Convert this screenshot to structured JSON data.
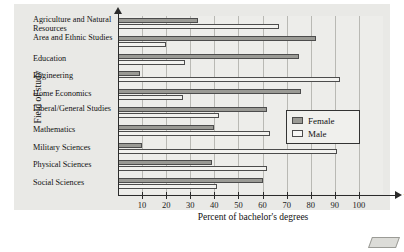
{
  "chart_data": {
    "type": "bar",
    "orientation": "horizontal",
    "title": "",
    "xlabel": "Percent of bachelor's degrees",
    "ylabel": "Field of study",
    "xlim": [
      0,
      110
    ],
    "xticks": [
      10,
      20,
      30,
      40,
      50,
      60,
      70,
      80,
      90,
      100
    ],
    "x_axis_symbol": "x",
    "grid": "vertical",
    "legend_position": "middle-right",
    "categories": [
      "Agriculture and Natural Resources",
      "Area and Ethnic Studies",
      "Education",
      "Engineering",
      "Home Economics",
      "Liberal/General Studies",
      "Mathematics",
      "Military Sciences",
      "Physical Sciences",
      "Social Sciences"
    ],
    "series": [
      {
        "name": "Female",
        "color": "#9a9a95",
        "values": [
          33,
          82,
          75,
          9,
          76,
          62,
          40,
          10,
          39,
          60
        ]
      },
      {
        "name": "Male",
        "color": "#f2f2ef",
        "values": [
          67,
          20,
          28,
          92,
          27,
          42,
          63,
          91,
          62,
          41
        ]
      }
    ]
  },
  "legend": {
    "items": [
      {
        "label": "Female"
      },
      {
        "label": "Male"
      }
    ]
  }
}
